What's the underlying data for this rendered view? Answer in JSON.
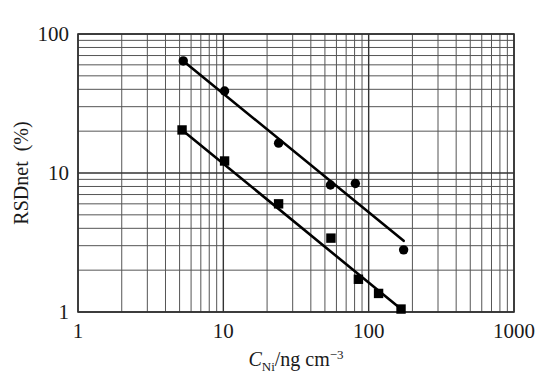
{
  "chart_data": {
    "type": "scatter",
    "title": "",
    "subtitle": "",
    "xlabel": "C_Ni/ng cm^-3",
    "xlabel_parts": {
      "italic": "C",
      "subscript": "Ni",
      "rest": "/ng cm",
      "superscript": "−3"
    },
    "ylabel": "RSDnet (%)",
    "xscale": "log",
    "yscale": "log",
    "xlim": [
      1,
      1000
    ],
    "ylim": [
      1,
      100
    ],
    "grid": true,
    "grid_minor": true,
    "legend": "none",
    "xticks": [
      1,
      10,
      100,
      1000
    ],
    "xtick_labels": [
      "1",
      "10",
      "100",
      "1000"
    ],
    "yticks": [
      1,
      10,
      100
    ],
    "ytick_labels": [
      "1",
      "10",
      "100"
    ],
    "series": [
      {
        "name": "circles",
        "marker": "circle",
        "marker_size": 7,
        "color": "#000000",
        "points": [
          {
            "x": 5.3,
            "y": 64.0
          },
          {
            "x": 10.2,
            "y": 38.9
          },
          {
            "x": 24.0,
            "y": 16.4
          },
          {
            "x": 54.6,
            "y": 8.2
          },
          {
            "x": 81.0,
            "y": 8.4
          },
          {
            "x": 174.0,
            "y": 2.8
          }
        ],
        "fit_line": {
          "x1": 5.3,
          "y1": 64.0,
          "x2": 174.0,
          "y2": 3.25
        }
      },
      {
        "name": "squares",
        "marker": "square",
        "marker_size": 7,
        "color": "#000000",
        "points": [
          {
            "x": 5.2,
            "y": 20.4
          },
          {
            "x": 10.2,
            "y": 12.2
          },
          {
            "x": 24.0,
            "y": 6.0
          },
          {
            "x": 55.0,
            "y": 3.4
          },
          {
            "x": 85.0,
            "y": 1.72
          },
          {
            "x": 117.0,
            "y": 1.36
          },
          {
            "x": 167.0,
            "y": 1.05
          }
        ],
        "fit_line": {
          "x1": 5.2,
          "y1": 20.4,
          "x2": 167.0,
          "y2": 1.05
        }
      }
    ]
  },
  "axes": {
    "x_title": "C",
    "x_sub": "Ni",
    "x_mid": "/ng cm",
    "x_sup": "−3",
    "y_title": "RSDnet (%)"
  }
}
